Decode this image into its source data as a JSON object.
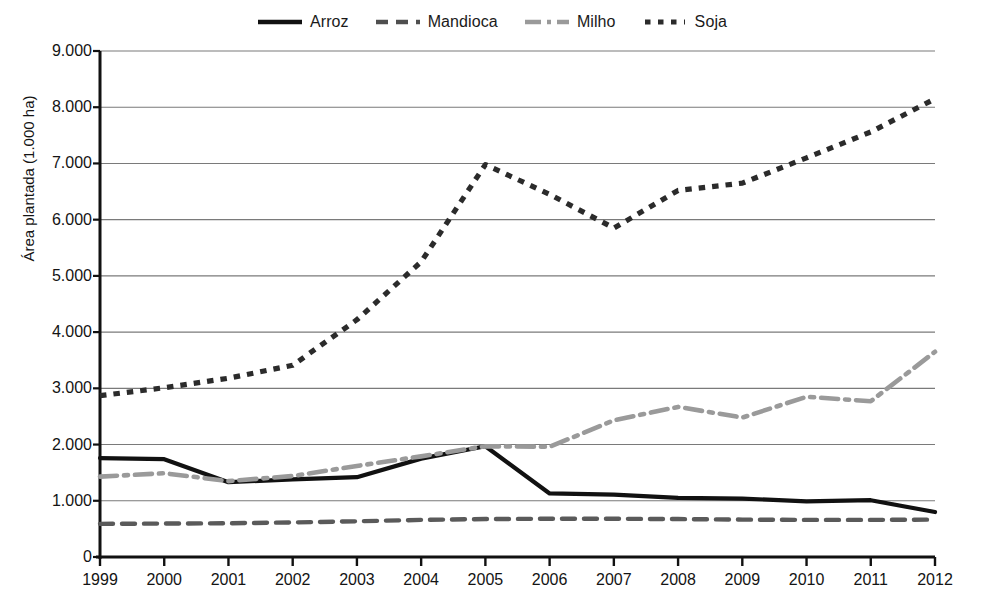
{
  "chart_data": {
    "type": "line",
    "title": "",
    "xlabel": "",
    "ylabel": "Área plantada (1.000 ha)",
    "categories": [
      "1999",
      "2000",
      "2001",
      "2002",
      "2003",
      "2004",
      "2005",
      "2006",
      "2007",
      "2008",
      "2009",
      "2010",
      "2011",
      "2012"
    ],
    "x": [
      1999,
      2000,
      2001,
      2002,
      2003,
      2004,
      2005,
      2006,
      2007,
      2008,
      2009,
      2010,
      2011,
      2012
    ],
    "ylim": [
      0,
      9000
    ],
    "ytick_values": [
      0,
      1000,
      2000,
      3000,
      4000,
      5000,
      6000,
      7000,
      8000,
      9000
    ],
    "ytick_labels": [
      "0",
      "1.000",
      "2.000",
      "3.000",
      "4.000",
      "5.000",
      "6.000",
      "7.000",
      "8.000",
      "9.000"
    ],
    "grid": "horizontal",
    "legend_position": "top-center",
    "series": [
      {
        "name": "Arroz",
        "style": "solid",
        "color": "#111111",
        "values": [
          1760,
          1740,
          1330,
          1380,
          1420,
          1750,
          1970,
          1130,
          1110,
          1050,
          1040,
          990,
          1010,
          800
        ]
      },
      {
        "name": "Mandioca",
        "style": "dashed",
        "color": "#5a5a5a",
        "values": [
          590,
          595,
          600,
          615,
          635,
          660,
          675,
          680,
          680,
          675,
          665,
          660,
          660,
          665
        ]
      },
      {
        "name": "Milho",
        "style": "dash-dot",
        "color": "#9a9a9a",
        "values": [
          1430,
          1490,
          1350,
          1440,
          1620,
          1790,
          1970,
          1960,
          2430,
          2670,
          2480,
          2850,
          2770,
          3650
        ]
      },
      {
        "name": "Soja",
        "style": "dotted",
        "color": "#2b2b2b",
        "values": [
          2870,
          3010,
          3180,
          3410,
          4220,
          5250,
          6980,
          6450,
          5850,
          6520,
          6650,
          7100,
          7560,
          8150
        ]
      }
    ]
  },
  "legend": {
    "items": [
      {
        "label": "Arroz",
        "icon": "solid-line-icon"
      },
      {
        "label": "Mandioca",
        "icon": "dashed-line-icon"
      },
      {
        "label": "Milho",
        "icon": "dash-dot-line-icon"
      },
      {
        "label": "Soja",
        "icon": "dotted-line-icon"
      }
    ]
  },
  "axes": {
    "y_title": "Área plantada (1.000 ha)"
  },
  "colors": {
    "arroz": "#111111",
    "mandioca": "#5a5a5a",
    "milho": "#9a9a9a",
    "soja": "#2b2b2b",
    "grid": "#7a7a7a",
    "axis": "#111111",
    "background": "#ffffff"
  }
}
